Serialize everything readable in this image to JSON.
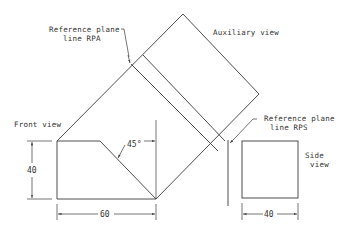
{
  "diagram": {
    "type": "orthographic-auxiliary-projection",
    "labels": {
      "reference_plane_rpa_line1": "Reference plane",
      "reference_plane_rpa_line2": "line RPA",
      "auxiliary_view": "Auxiliary view",
      "front_view": "Front view",
      "reference_plane_rps_line1": "Reference plane",
      "reference_plane_rps_line2": "line RPS",
      "side_view_line1": "Side",
      "side_view_line2": "view"
    },
    "dimensions": {
      "front_height": "40",
      "front_width": "60",
      "angle": "45°",
      "side_width": "40"
    },
    "colors": {
      "line": "#3a3a3a",
      "background": "#ffffff"
    }
  }
}
